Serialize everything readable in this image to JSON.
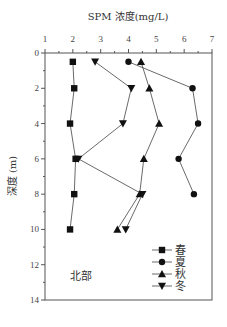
{
  "chart_data": {
    "type": "line",
    "title": "SPM 浓度(mg/L)",
    "xlabel": "SPM 浓度(mg/L)",
    "ylabel": "深度 (m)",
    "xlim": [
      1,
      7
    ],
    "ylim": [
      0,
      14
    ],
    "y_inverted": true,
    "x_axis_position": "top",
    "x_ticks": [
      1,
      2,
      3,
      4,
      5,
      6,
      7
    ],
    "y_ticks": [
      0,
      2,
      4,
      6,
      8,
      10,
      12,
      14
    ],
    "grid": false,
    "annotation": "北部",
    "legend_position": "lower right",
    "series": [
      {
        "name": "春",
        "marker": "square",
        "depth": [
          0.5,
          2,
          4,
          6,
          8,
          10
        ],
        "values": [
          2.0,
          2.05,
          1.9,
          2.1,
          2.05,
          1.9
        ]
      },
      {
        "name": "夏",
        "marker": "circle",
        "depth": [
          0.5,
          2,
          4,
          6,
          8
        ],
        "values": [
          4.0,
          6.3,
          6.5,
          5.8,
          6.35
        ]
      },
      {
        "name": "秋",
        "marker": "triangle-up",
        "depth": [
          0.5,
          2,
          4,
          6,
          8,
          10
        ],
        "values": [
          4.45,
          4.75,
          5.1,
          4.55,
          4.4,
          3.6
        ]
      },
      {
        "name": "冬",
        "marker": "triangle-down",
        "depth": [
          0.5,
          2,
          4,
          6,
          8,
          10
        ],
        "values": [
          2.8,
          4.1,
          3.8,
          2.2,
          4.5,
          3.9
        ]
      }
    ]
  }
}
